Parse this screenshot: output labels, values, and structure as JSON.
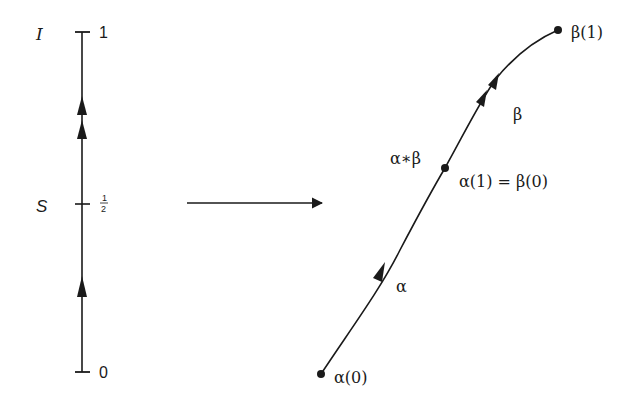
{
  "interval": {
    "name_label": "I",
    "subset_label": "S",
    "tick_top": "1",
    "tick_mid_num": "1",
    "tick_mid_den": "2",
    "tick_bottom": "0"
  },
  "mapping_arrow": "→",
  "path": {
    "label_composite": "α∗β",
    "label_alpha": "α",
    "label_beta": "β",
    "start_point": "α(0)",
    "mid_point": "α(1) = β(0)",
    "end_point": "β(1)"
  },
  "colors": {
    "ink": "#1a1a1a",
    "background": "#ffffff"
  }
}
